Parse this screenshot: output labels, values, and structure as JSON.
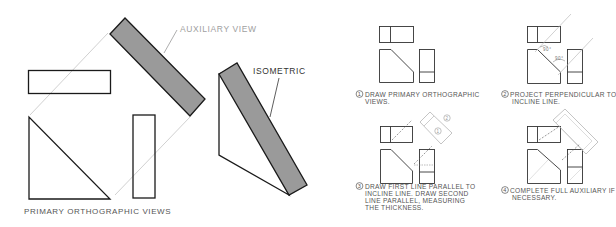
{
  "figure": {
    "left_panel": {
      "auxiliary_label": "AUXILIARY VIEW",
      "isometric_label": "ISOMETRIC",
      "primary_label": "PRIMARY ORTHOGRAPHIC VIEWS"
    },
    "steps": [
      {
        "number": "1",
        "lines": [
          "DRAW PRIMARY ORTHOGRAPHIC",
          "VIEWS."
        ]
      },
      {
        "number": "2",
        "lines": [
          "PROJECT PERPENDICULAR TO",
          "INCLINE LINE."
        ],
        "angle_labels": [
          "90°",
          "90°"
        ]
      },
      {
        "number": "3",
        "lines": [
          "DRAW FIRST LINE PARALLEL TO",
          "INCLINE LINE.  DRAW SECOND",
          "LINE PARALLEL, MEASURING",
          "THE THICKNESS."
        ],
        "circled_marks": [
          "1",
          "2"
        ]
      },
      {
        "number": "4",
        "lines": [
          "COMPLETE FULL AUXILIARY IF",
          "NECESSARY."
        ]
      }
    ]
  },
  "colors": {
    "stroke": "#1a1a1a",
    "fill_gray": "#9a9a9a",
    "faint_line": "#b8b8b8",
    "label_gray": "#999999",
    "text": "#444444"
  }
}
